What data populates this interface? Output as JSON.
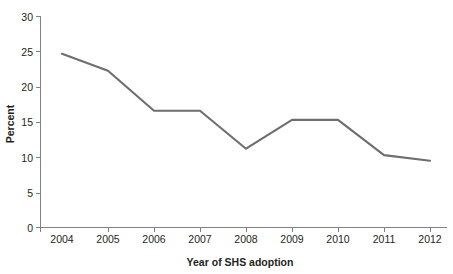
{
  "chart_data": {
    "type": "line",
    "title": "",
    "xlabel": "Year of SHS adoption",
    "ylabel": "Percent",
    "categories": [
      "2004",
      "2005",
      "2006",
      "2007",
      "2008",
      "2009",
      "2010",
      "2011",
      "2012"
    ],
    "x": [
      2004,
      2005,
      2006,
      2007,
      2008,
      2009,
      2010,
      2011,
      2012
    ],
    "values": [
      24.7,
      22.3,
      16.6,
      16.6,
      11.2,
      15.3,
      15.3,
      10.3,
      9.5
    ],
    "series": [
      {
        "name": "Percent",
        "values": [
          24.7,
          22.3,
          16.6,
          16.6,
          11.2,
          15.3,
          15.3,
          10.3,
          9.5
        ]
      }
    ],
    "ylim": [
      0,
      30
    ],
    "yticks": [
      0,
      5,
      10,
      15,
      20,
      25,
      30
    ],
    "ytick_labels": [
      "0",
      "5",
      "10",
      "15",
      "20",
      "25",
      "30"
    ],
    "xtick_labels": [
      "2004",
      "2005",
      "2006",
      "2007",
      "2008",
      "2009",
      "2010",
      "2011",
      "2012"
    ],
    "grid": false,
    "legend": null,
    "legend_position": "none",
    "line_color": "#6d6e71",
    "axis_color": "#808285",
    "text_color": "#231f20",
    "background_color": "#ffffff"
  },
  "axes": {
    "y_title": "Percent",
    "x_title": "Year of SHS adoption"
  },
  "ticks": {
    "y": [
      "30",
      "25",
      "20",
      "15",
      "10",
      "5",
      "0"
    ],
    "x": [
      "2004",
      "2005",
      "2006",
      "2007",
      "2008",
      "2009",
      "2010",
      "2011",
      "2012"
    ]
  }
}
